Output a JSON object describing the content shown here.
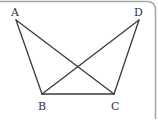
{
  "diagram": {
    "type": "geometry-figure",
    "colors": {
      "line": "#3a3a3a",
      "frame": "#a8a8a8",
      "label": "#333333",
      "background": "#ffffff"
    },
    "points": [
      {
        "id": "A",
        "label": "A",
        "x": 16,
        "y": 20,
        "label_x": 11,
        "label_y": 16
      },
      {
        "id": "D",
        "label": "D",
        "x": 139,
        "y": 20,
        "label_x": 134,
        "label_y": 16
      },
      {
        "id": "B",
        "label": "B",
        "x": 42,
        "y": 94,
        "label_x": 38,
        "label_y": 110
      },
      {
        "id": "C",
        "label": "C",
        "x": 114,
        "y": 94,
        "label_x": 111,
        "label_y": 110
      }
    ],
    "segments": [
      {
        "from": "A",
        "to": "B"
      },
      {
        "from": "A",
        "to": "C"
      },
      {
        "from": "D",
        "to": "B"
      },
      {
        "from": "D",
        "to": "C"
      },
      {
        "from": "B",
        "to": "C"
      }
    ]
  }
}
